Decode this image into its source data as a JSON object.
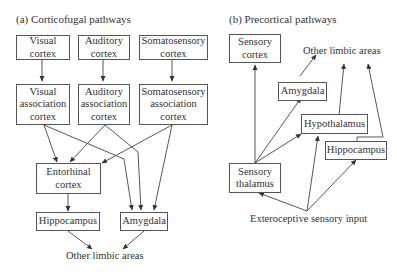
{
  "panel_a": {
    "title": "(a) Corticofugal pathways",
    "nodes": {
      "visual_cortex": "Visual\ncortex",
      "auditory_cortex": "Auditory\ncortex",
      "somatosensory_cortex": "Somatosensory\ncortex",
      "visual_assoc": "Visual\nassociation\ncortex",
      "auditory_assoc": "Auditory\nassociation\ncortex",
      "somatosensory_assoc": "Somatosensory\nassociation\ncortex",
      "entorhinal": "Entorhinal\ncortex",
      "hippocampus": "Hippocampus",
      "amygdala": "Amygdala",
      "other_limbic": "Other limbic areas"
    }
  },
  "panel_b": {
    "title": "(b) Precortical pathways",
    "nodes": {
      "sensory_cortex": "Sensory\ncortex",
      "other_limbic": "Other limbic areas",
      "amygdala": "Amygdala",
      "hypothalamus": "Hypothalamus",
      "hippocampus": "Hippocampus",
      "sensory_thalamus": "Sensory\nthalamus",
      "exteroceptive": "Exteroceptive sensory input"
    }
  },
  "edges": {
    "panel_a": [
      [
        "Visual cortex",
        "Visual association cortex"
      ],
      [
        "Auditory cortex",
        "Auditory association cortex"
      ],
      [
        "Somatosensory cortex",
        "Somatosensory association cortex"
      ],
      [
        "Visual association cortex",
        "Entorhinal cortex"
      ],
      [
        "Visual association cortex",
        "Amygdala"
      ],
      [
        "Auditory association cortex",
        "Entorhinal cortex"
      ],
      [
        "Auditory association cortex",
        "Amygdala"
      ],
      [
        "Somatosensory association cortex",
        "Entorhinal cortex"
      ],
      [
        "Somatosensory association cortex",
        "Amygdala"
      ],
      [
        "Entorhinal cortex",
        "Hippocampus"
      ],
      [
        "Hippocampus",
        "Other limbic areas"
      ],
      [
        "Amygdala",
        "Other limbic areas"
      ]
    ],
    "panel_b": [
      [
        "Sensory thalamus",
        "Sensory cortex"
      ],
      [
        "Sensory thalamus",
        "Amygdala"
      ],
      [
        "Sensory thalamus",
        "Hypothalamus"
      ],
      [
        "Amygdala",
        "Other limbic areas"
      ],
      [
        "Hypothalamus",
        "Other limbic areas"
      ],
      [
        "Hippocampus",
        "Other limbic areas"
      ],
      [
        "Exteroceptive sensory input",
        "Sensory thalamus"
      ],
      [
        "Exteroceptive sensory input",
        "Hypothalamus"
      ],
      [
        "Exteroceptive sensory input",
        "Hippocampus"
      ]
    ]
  }
}
